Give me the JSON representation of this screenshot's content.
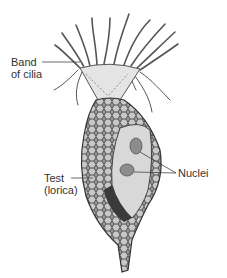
{
  "diagram": {
    "labels": {
      "cilia": [
        "Band",
        "of cilia"
      ],
      "test": [
        "Test",
        "(lorica)"
      ],
      "nuclei": "Nuclei"
    },
    "colors": {
      "text": "#333333",
      "leader_line": "#444444",
      "test_fill": "#8a8a8a",
      "test_dark": "#3a3a3a",
      "cell_fill": "#d8d8d8",
      "nucleus_fill": "#8c8c8c",
      "collar_fill": "#e4e4e4"
    }
  }
}
